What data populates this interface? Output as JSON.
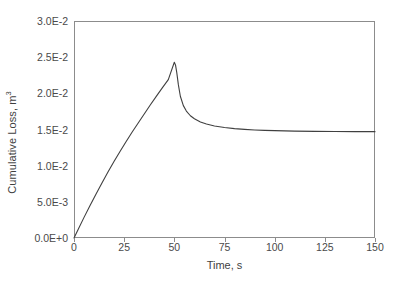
{
  "chart_data": {
    "type": "line",
    "title": "",
    "xlabel": "Time, s",
    "ylabel": "Cumulative Loss, m³",
    "xlim": [
      0,
      150
    ],
    "ylim": [
      0,
      0.03
    ],
    "xticks": [
      0,
      25,
      50,
      75,
      100,
      125,
      150
    ],
    "xticklabels": [
      "0",
      "25",
      "50",
      "75",
      "100",
      "125",
      "150"
    ],
    "yticks": [
      0.0,
      0.005,
      0.01,
      0.015,
      0.02,
      0.025,
      0.03
    ],
    "yticklabels": [
      "0.0E+0",
      "5.0E-3",
      "1.0E-2",
      "1.5E-2",
      "2.0E-2",
      "2.5E-2",
      "3.0E-2"
    ],
    "grid": false,
    "legend": null,
    "line_color": "#404040",
    "line_width": 1.1,
    "series": [
      {
        "name": "Cumulative Loss",
        "x": [
          0,
          2,
          5,
          8,
          11,
          14,
          17,
          20,
          23,
          26,
          29,
          32,
          35,
          38,
          41,
          44,
          47,
          50,
          50.6,
          51.2,
          52,
          53,
          54.5,
          56,
          58,
          60,
          63,
          66,
          70,
          75,
          80,
          85,
          90,
          95,
          100,
          110,
          120,
          130,
          140,
          150
        ],
        "y": [
          0.0,
          0.00115,
          0.00285,
          0.0045,
          0.0061,
          0.00765,
          0.00915,
          0.0106,
          0.012,
          0.01335,
          0.01465,
          0.0159,
          0.01715,
          0.01838,
          0.01958,
          0.02075,
          0.0219,
          0.0243,
          0.0239,
          0.0229,
          0.0212,
          0.0196,
          0.0183,
          0.01755,
          0.0169,
          0.01648,
          0.01603,
          0.01575,
          0.01549,
          0.01527,
          0.01512,
          0.01502,
          0.01494,
          0.01488,
          0.01484,
          0.01478,
          0.01474,
          0.01472,
          0.01471,
          0.0147
        ]
      }
    ],
    "annotations": {
      "peak_time": 50,
      "peak_value": 0.0243,
      "plateau_value": 0.0147
    }
  },
  "axes": {
    "frame_color": "#8c8c8c"
  }
}
